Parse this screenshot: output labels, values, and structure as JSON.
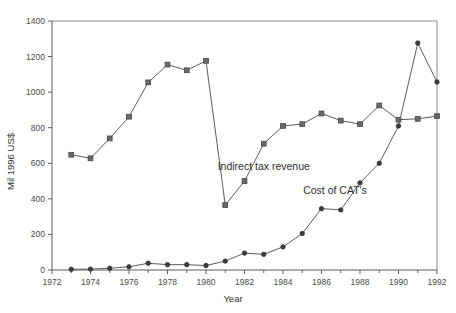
{
  "chart_data": {
    "type": "line",
    "title": "",
    "xlabel": "Year",
    "ylabel": "Mil 1996 US$",
    "xlim": [
      1972,
      1992
    ],
    "ylim": [
      0,
      1400
    ],
    "grid": false,
    "legend_position": "inline-annotation",
    "x_ticks": [
      1972,
      1974,
      1976,
      1978,
      1980,
      1982,
      1984,
      1986,
      1988,
      1990,
      1992
    ],
    "x_tick_labels": [
      "1972",
      "1974",
      "1976",
      "1978",
      "1980",
      "1982",
      "1984",
      "1986",
      "1988",
      "1990",
      "1992"
    ],
    "x_minor_ticks": [
      1973,
      1975,
      1977,
      1979,
      1981,
      1983,
      1985,
      1987,
      1989,
      1991
    ],
    "y_ticks": [
      0,
      200,
      400,
      600,
      800,
      1000,
      1200,
      1400
    ],
    "y_tick_labels": [
      "0",
      "200",
      "400",
      "600",
      "800",
      "1000",
      "1200",
      "1400"
    ],
    "series": [
      {
        "name": "Indirect tax revenue",
        "marker": "square",
        "color": "#6b6b6b",
        "annotation": "Indirect tax revenue",
        "annotation_x": 1983.0,
        "annotation_y": 560,
        "x": [
          1973,
          1974,
          1975,
          1976,
          1977,
          1978,
          1979,
          1980,
          1981,
          1982,
          1983,
          1984,
          1985,
          1986,
          1987,
          1988,
          1989,
          1990,
          1991,
          1992
        ],
        "values": [
          648,
          628,
          740,
          862,
          1055,
          1155,
          1123,
          1176,
          365,
          500,
          710,
          810,
          820,
          880,
          840,
          820,
          925,
          845,
          850,
          865
        ]
      },
      {
        "name": "Cost of CAT's",
        "marker": "circle",
        "color": "#3d3d3d",
        "annotation": "Cost of CAT's",
        "annotation_x": 1986.7,
        "annotation_y": 430,
        "x": [
          1973,
          1974,
          1975,
          1976,
          1977,
          1978,
          1979,
          1980,
          1981,
          1982,
          1983,
          1984,
          1985,
          1986,
          1987,
          1988,
          1989,
          1990,
          1991,
          1992
        ],
        "values": [
          4,
          5,
          10,
          18,
          38,
          30,
          30,
          25,
          50,
          95,
          88,
          130,
          205,
          345,
          338,
          490,
          600,
          810,
          1276,
          1057
        ]
      }
    ]
  },
  "axes": {
    "y_axis_title": "Mil 1996 US$",
    "x_axis_title": "Year"
  }
}
